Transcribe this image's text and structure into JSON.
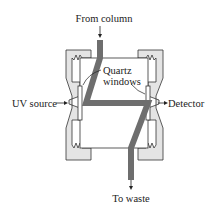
{
  "diagram": {
    "type": "UV absorbance flow cell (HPLC detector)",
    "labels": {
      "inlet": "From column",
      "outlet": "To waste",
      "windows_line1": "Quartz",
      "windows_line2": "windows",
      "source": "UV source",
      "detector": "Detector"
    },
    "colors": {
      "flow_path": "#6e6e6e",
      "housing_fill": "#e4e4e4",
      "outline": "#333333",
      "text": "#222222"
    }
  }
}
